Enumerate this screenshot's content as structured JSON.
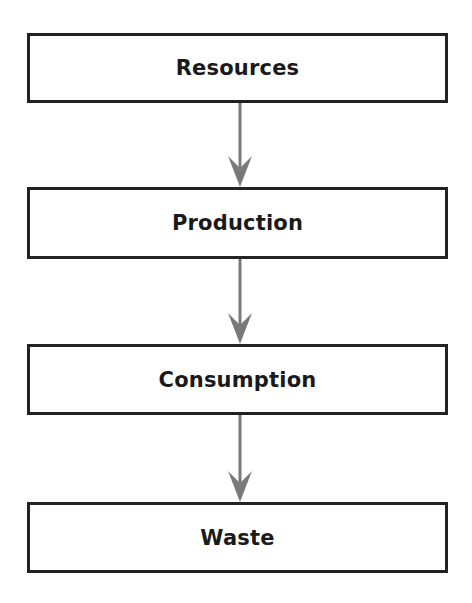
{
  "diagram": {
    "type": "vertical-flowchart",
    "nodes": [
      {
        "id": "resources",
        "label": "Resources"
      },
      {
        "id": "production",
        "label": "Production"
      },
      {
        "id": "consumption",
        "label": "Consumption"
      },
      {
        "id": "waste",
        "label": "Waste"
      }
    ],
    "edges": [
      {
        "from": "resources",
        "to": "production"
      },
      {
        "from": "production",
        "to": "consumption"
      },
      {
        "from": "consumption",
        "to": "waste"
      }
    ],
    "colors": {
      "box_border": "#222222",
      "arrow": "#7a7a7a",
      "text": "#1a1a1a",
      "background": "#ffffff"
    }
  }
}
